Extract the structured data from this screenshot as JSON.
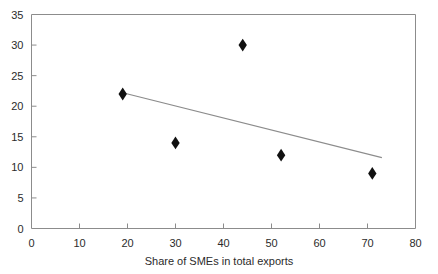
{
  "chart_data": {
    "type": "scatter",
    "title": "",
    "xlabel": "Share of SMEs in total exports",
    "ylabel": "",
    "xlim": [
      0,
      80
    ],
    "ylim": [
      0,
      35
    ],
    "xticks": [
      0,
      10,
      20,
      30,
      40,
      50,
      60,
      70,
      80
    ],
    "xtick_labels": [
      "0",
      "10",
      "20",
      "30",
      "40",
      "50",
      "60",
      "70",
      "80"
    ],
    "yticks": [
      0,
      5,
      10,
      15,
      20,
      25,
      30,
      35
    ],
    "ytick_labels": [
      "0",
      "5",
      "10",
      "15",
      "20",
      "25",
      "30",
      "35"
    ],
    "grid": false,
    "legend": null,
    "marker": "diamond",
    "marker_color": "#111111",
    "points": [
      {
        "x": 19,
        "y": 22
      },
      {
        "x": 30,
        "y": 14
      },
      {
        "x": 44,
        "y": 30
      },
      {
        "x": 52,
        "y": 12
      },
      {
        "x": 71,
        "y": 9
      }
    ],
    "trendline": {
      "type": "line",
      "color": "#8c8c8c",
      "x": [
        19,
        73
      ],
      "y": [
        22.2,
        11.6
      ]
    },
    "axis_color": "#8c8c8c",
    "text_color": "#2b2b2b"
  },
  "labels": {
    "xaxis_title": "Share of SMEs in total exports"
  }
}
